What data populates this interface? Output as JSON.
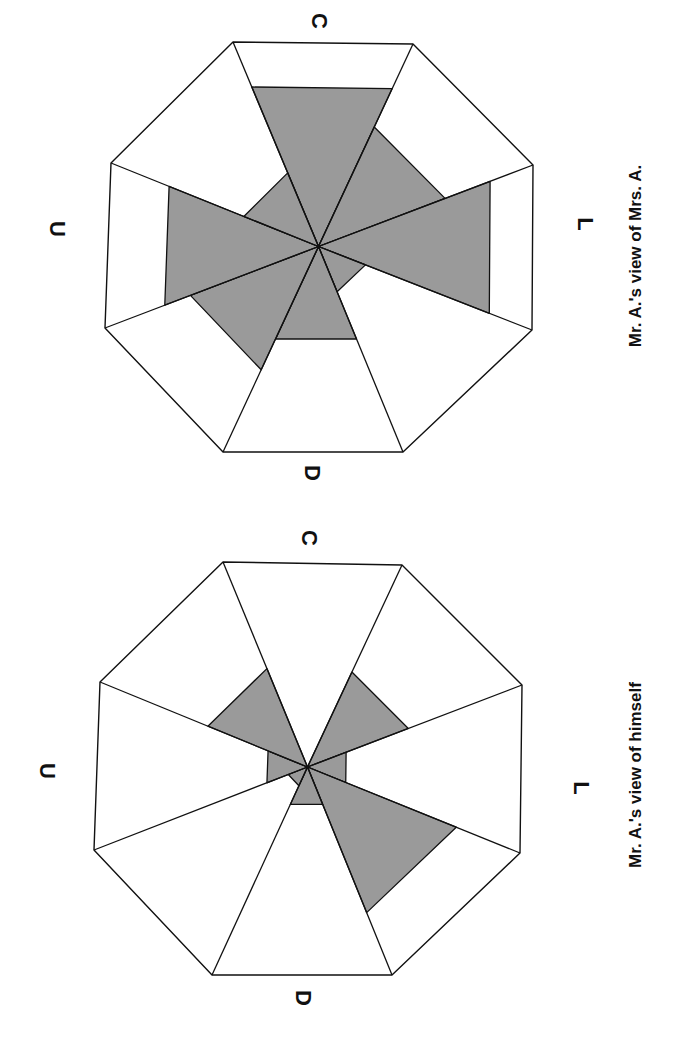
{
  "figure": {
    "rotation_deg": 90,
    "fill_color": "#9a9a9a",
    "line_color": "#111111"
  },
  "chart_data": [
    {
      "type": "radar-sector",
      "title": "Mr. A.'s view of Mrs. A.",
      "axis_labels": {
        "top": "C",
        "right": "L",
        "bottom": "D",
        "left": "U"
      },
      "sectors": [
        "top",
        "top-right",
        "right",
        "bottom-right",
        "bottom",
        "bottom-left",
        "left",
        "top-left"
      ],
      "values": [
        0.78,
        0.59,
        0.8,
        0.22,
        0.45,
        0.6,
        0.72,
        0.36
      ],
      "scale": [
        0,
        1
      ]
    },
    {
      "type": "radar-sector",
      "title": "Mr. A.'s view of himself",
      "axis_labels": {
        "top": "C",
        "right": "L",
        "bottom": "D",
        "left": "U"
      },
      "sectors": [
        "top",
        "top-right",
        "right",
        "bottom-right",
        "bottom",
        "bottom-left",
        "left",
        "top-left"
      ],
      "values": [
        0.0,
        0.47,
        0.18,
        0.7,
        0.18,
        0.09,
        0.19,
        0.48
      ],
      "scale": [
        0,
        1
      ]
    }
  ],
  "charts": [
    {
      "caption": "Mr. A.'s view of Mrs. A.",
      "labels": {
        "C": "C",
        "L": "L",
        "D": "D",
        "U": "U"
      }
    },
    {
      "caption": "Mr. A.'s view of himself",
      "labels": {
        "C": "C",
        "L": "L",
        "D": "D",
        "U": "U"
      }
    }
  ]
}
